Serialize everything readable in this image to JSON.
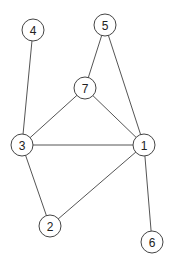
{
  "diagram": {
    "type": "undirected-graph",
    "node_radius": 11,
    "colors": {
      "background": "#ffffff",
      "edge": "#555555",
      "node_stroke": "#444444",
      "node_fill": "#ffffff",
      "label": "#222222"
    },
    "nodes": [
      {
        "id": "1",
        "label": "1",
        "x": 144,
        "y": 145
      },
      {
        "id": "2",
        "label": "2",
        "x": 50,
        "y": 226
      },
      {
        "id": "3",
        "label": "3",
        "x": 22,
        "y": 145
      },
      {
        "id": "4",
        "label": "4",
        "x": 33,
        "y": 30
      },
      {
        "id": "5",
        "label": "5",
        "x": 105,
        "y": 25
      },
      {
        "id": "6",
        "label": "6",
        "x": 152,
        "y": 242
      },
      {
        "id": "7",
        "label": "7",
        "x": 85,
        "y": 88
      }
    ],
    "edges": [
      {
        "from": "4",
        "to": "3"
      },
      {
        "from": "5",
        "to": "7"
      },
      {
        "from": "5",
        "to": "1"
      },
      {
        "from": "7",
        "to": "3"
      },
      {
        "from": "7",
        "to": "1"
      },
      {
        "from": "3",
        "to": "1"
      },
      {
        "from": "3",
        "to": "2"
      },
      {
        "from": "2",
        "to": "1"
      },
      {
        "from": "1",
        "to": "6"
      }
    ]
  }
}
